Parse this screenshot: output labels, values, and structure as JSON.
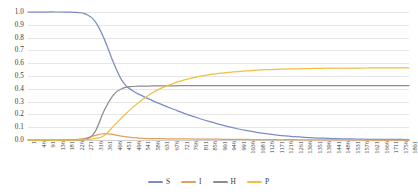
{
  "chart_data": {
    "type": "line",
    "title": "",
    "xlabel": "",
    "ylabel": "",
    "ylim": [
      0,
      1
    ],
    "xlim": [
      1,
      1801
    ],
    "grid": true,
    "legend_position": "bottom",
    "y_ticks": [
      "1.0",
      "0.9",
      "0.8",
      "0.7",
      "0.6",
      "0.5",
      "0.4",
      "0.3",
      "0.2",
      "0.1",
      "0.0"
    ],
    "categories": [
      1,
      46,
      91,
      136,
      181,
      226,
      271,
      316,
      361,
      406,
      451,
      496,
      541,
      586,
      631,
      676,
      721,
      766,
      811,
      856,
      901,
      946,
      991,
      1036,
      1081,
      1126,
      1171,
      1216,
      1261,
      1306,
      1351,
      1396,
      1441,
      1486,
      1531,
      1576,
      1621,
      1666,
      1711,
      1756,
      1801
    ],
    "series": [
      {
        "name": "S",
        "color": "#7b8cc4",
        "values": [
          1.0,
          1.0,
          1.0,
          1.0,
          0.999,
          0.997,
          0.985,
          0.93,
          0.79,
          0.6,
          0.45,
          0.385,
          0.345,
          0.31,
          0.278,
          0.248,
          0.22,
          0.193,
          0.168,
          0.145,
          0.124,
          0.105,
          0.088,
          0.073,
          0.06,
          0.049,
          0.04,
          0.032,
          0.026,
          0.021,
          0.017,
          0.014,
          0.011,
          0.009,
          0.008,
          0.006,
          0.005,
          0.005,
          0.004,
          0.004,
          0.003
        ]
      },
      {
        "name": "I",
        "color": "#e0a060",
        "values": [
          0.0,
          0.0,
          0.0,
          0.0,
          0.001,
          0.003,
          0.012,
          0.035,
          0.05,
          0.042,
          0.028,
          0.018,
          0.013,
          0.011,
          0.01,
          0.009,
          0.008,
          0.008,
          0.007,
          0.006,
          0.006,
          0.005,
          0.004,
          0.004,
          0.003,
          0.003,
          0.002,
          0.002,
          0.002,
          0.001,
          0.001,
          0.001,
          0.001,
          0.001,
          0.001,
          0.0,
          0.0,
          0.0,
          0.0,
          0.0,
          0.0
        ]
      },
      {
        "name": "H",
        "color": "#8c8c8c",
        "values": [
          0.0,
          0.0,
          0.0,
          0.0,
          0.0,
          0.001,
          0.005,
          0.06,
          0.23,
          0.355,
          0.405,
          0.418,
          0.421,
          0.422,
          0.423,
          0.423,
          0.424,
          0.424,
          0.424,
          0.424,
          0.424,
          0.424,
          0.424,
          0.424,
          0.424,
          0.424,
          0.424,
          0.424,
          0.424,
          0.424,
          0.424,
          0.424,
          0.424,
          0.424,
          0.424,
          0.424,
          0.424,
          0.424,
          0.424,
          0.424,
          0.424
        ]
      },
      {
        "name": "P",
        "color": "#f0c040",
        "values": [
          0.0,
          0.0,
          0.0,
          0.0,
          0.0,
          0.0,
          0.002,
          0.01,
          0.035,
          0.11,
          0.185,
          0.255,
          0.315,
          0.365,
          0.405,
          0.435,
          0.46,
          0.48,
          0.497,
          0.51,
          0.52,
          0.528,
          0.535,
          0.54,
          0.545,
          0.549,
          0.552,
          0.554,
          0.556,
          0.557,
          0.559,
          0.56,
          0.561,
          0.561,
          0.562,
          0.562,
          0.563,
          0.563,
          0.563,
          0.564,
          0.564
        ]
      }
    ]
  },
  "legend": {
    "items": [
      {
        "label": "S",
        "color": "#7b8cc4"
      },
      {
        "label": "I",
        "color": "#e0a060"
      },
      {
        "label": "H",
        "color": "#8c8c8c"
      },
      {
        "label": "P",
        "color": "#f0c040"
      }
    ]
  }
}
